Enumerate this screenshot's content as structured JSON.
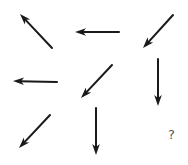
{
  "puzzle": {
    "description": "3x3 arrow direction sequence puzzle",
    "stroke_color": "#1a1a1a",
    "cells": [
      {
        "row": 1,
        "col": 1,
        "direction": "up-left",
        "tail": [
          52,
          48
        ],
        "head": [
          20,
          14
        ]
      },
      {
        "row": 1,
        "col": 2,
        "direction": "left",
        "tail": [
          119,
          32
        ],
        "head": [
          75,
          32
        ]
      },
      {
        "row": 1,
        "col": 3,
        "direction": "down-left",
        "tail": [
          173,
          15
        ],
        "head": [
          143,
          48
        ]
      },
      {
        "row": 2,
        "col": 1,
        "direction": "left",
        "tail": [
          57,
          82
        ],
        "head": [
          13,
          81
        ]
      },
      {
        "row": 2,
        "col": 2,
        "direction": "down-left",
        "tail": [
          112,
          65
        ],
        "head": [
          81,
          98
        ]
      },
      {
        "row": 2,
        "col": 3,
        "direction": "down",
        "tail": [
          158,
          59
        ],
        "head": [
          158,
          106
        ]
      },
      {
        "row": 3,
        "col": 1,
        "direction": "down-left",
        "tail": [
          50,
          115
        ],
        "head": [
          19,
          148
        ]
      },
      {
        "row": 3,
        "col": 2,
        "direction": "down",
        "tail": [
          96,
          108
        ],
        "head": [
          96,
          155
        ]
      }
    ],
    "missing": {
      "row": 3,
      "col": 3,
      "label": "?",
      "x": 168,
      "y": 128
    }
  }
}
